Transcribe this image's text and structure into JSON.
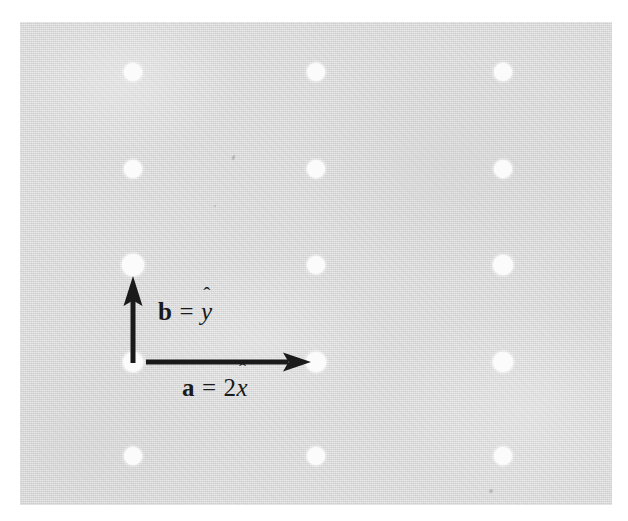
{
  "figure": {
    "kind": "crystal-lattice-diagram",
    "background_color": "#d9d9d9",
    "page_color": "#ffffff",
    "dot_color": "#fbfbfb",
    "arrow_color": "#1a1a1a",
    "panel": {
      "x": 20,
      "y": 22,
      "width": 592,
      "height": 483
    }
  },
  "lattice": {
    "columns_x": [
      133,
      316,
      503
    ],
    "rows_y": [
      72,
      169,
      265,
      362,
      456
    ],
    "dots": [
      {
        "x": 133,
        "y": 72,
        "r": 9
      },
      {
        "x": 316,
        "y": 72,
        "r": 9
      },
      {
        "x": 503,
        "y": 72,
        "r": 9
      },
      {
        "x": 133,
        "y": 169,
        "r": 9
      },
      {
        "x": 316,
        "y": 169,
        "r": 9
      },
      {
        "x": 503,
        "y": 169,
        "r": 9
      },
      {
        "x": 133,
        "y": 265,
        "r": 11
      },
      {
        "x": 316,
        "y": 265,
        "r": 9
      },
      {
        "x": 503,
        "y": 265,
        "r": 10
      },
      {
        "x": 133,
        "y": 362,
        "r": 10
      },
      {
        "x": 316,
        "y": 362,
        "r": 10
      },
      {
        "x": 503,
        "y": 362,
        "r": 10
      },
      {
        "x": 133,
        "y": 456,
        "r": 9
      },
      {
        "x": 316,
        "y": 456,
        "r": 9
      },
      {
        "x": 503,
        "y": 456,
        "r": 9
      }
    ]
  },
  "vectors": {
    "origin": {
      "x": 133,
      "y": 362
    },
    "b": {
      "label_name": "b",
      "label_eq": "=",
      "label_coefficient": "",
      "label_unit": "y",
      "label_hat": "ˆ",
      "label_plain": "b = ŷ",
      "from": {
        "x": 133,
        "y": 362
      },
      "to": {
        "x": 133,
        "y": 277
      },
      "direction": "up",
      "magnitude": 1
    },
    "a": {
      "label_name": "a",
      "label_eq": "=",
      "label_coefficient": "2",
      "label_unit": "x",
      "label_hat": "ˆ",
      "label_plain": "a = 2x̂",
      "from": {
        "x": 145,
        "y": 362
      },
      "to": {
        "x": 310,
        "y": 362
      },
      "direction": "right",
      "magnitude": 2
    }
  }
}
